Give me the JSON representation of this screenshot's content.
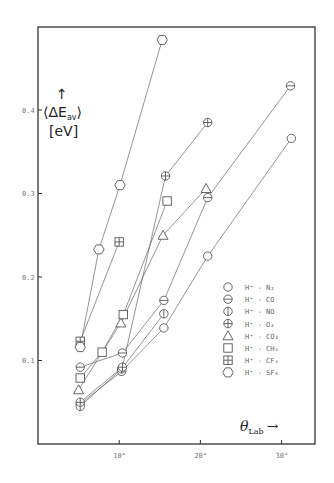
{
  "chart_data": {
    "type": "line",
    "title": "",
    "xlabel": "θ_Lab →",
    "ylabel": "↑ ⟨ΔE_av⟩ [eV]",
    "xlim": [
      0,
      34
    ],
    "ylim": [
      0,
      0.5
    ],
    "x_ticks": [
      {
        "value": 10,
        "label": "10°"
      },
      {
        "value": 20,
        "label": "20°"
      },
      {
        "value": 30,
        "label": "30°"
      }
    ],
    "y_ticks": [
      {
        "value": 0.1,
        "label": "0.1"
      },
      {
        "value": 0.2,
        "label": "0.2"
      },
      {
        "value": 0.3,
        "label": "0.3"
      },
      {
        "value": 0.4,
        "label": "0.4"
      }
    ],
    "grid": false,
    "legend_position": "right-middle",
    "series": [
      {
        "name": "H+ - N2",
        "marker": "circle",
        "x": [
          5.2,
          10.3,
          15.5,
          20.9,
          31.2
        ],
        "y": [
          0.048,
          0.087,
          0.139,
          0.225,
          0.366
        ]
      },
      {
        "name": "H+ - CO",
        "marker": "circle-hbar",
        "x": [
          5.2,
          10.4,
          15.5,
          20.9,
          31.1
        ],
        "y": [
          0.092,
          0.109,
          0.172,
          0.295,
          0.429
        ]
      },
      {
        "name": "H+ - NO",
        "marker": "circle-vbar",
        "x": [
          5.2,
          10.3,
          15.5
        ],
        "y": [
          0.045,
          0.09,
          0.156
        ]
      },
      {
        "name": "H+ - O2",
        "marker": "circle-cross",
        "x": [
          5.2,
          10.4,
          15.7,
          20.9
        ],
        "y": [
          0.05,
          0.092,
          0.321,
          0.385
        ]
      },
      {
        "name": "H+ - CO2",
        "marker": "triangle",
        "x": [
          5.0,
          10.2,
          15.4,
          20.7
        ],
        "y": [
          0.065,
          0.145,
          0.25,
          0.306
        ]
      },
      {
        "name": "H+ - CH4",
        "marker": "square",
        "x": [
          5.2,
          7.9,
          10.5,
          15.9
        ],
        "y": [
          0.079,
          0.11,
          0.155,
          0.291
        ]
      },
      {
        "name": "H+ - CF4",
        "marker": "square-vbar",
        "x": [
          5.2,
          10.0
        ],
        "y": [
          0.123,
          0.242
        ]
      },
      {
        "name": "H+ - SF6",
        "marker": "hexagon",
        "x": [
          5.2,
          7.5,
          10.1,
          15.3
        ],
        "y": [
          0.116,
          0.233,
          0.31,
          0.484
        ]
      }
    ]
  },
  "axes": {
    "y_label_arrow": "↑",
    "y_label_main": "⟨ΔE",
    "y_label_sub": "av",
    "y_label_close": "⟩",
    "y_unit": "[eV]",
    "x_label_main": "θ",
    "x_label_sub": "Lab",
    "x_label_arrow": "→"
  },
  "legend": [
    {
      "marker": "circle",
      "label": "H⁺ - N₂"
    },
    {
      "marker": "circle-hbar",
      "label": "H⁺ - CO"
    },
    {
      "marker": "circle-vbar",
      "label": "H⁺ - NO"
    },
    {
      "marker": "circle-cross",
      "label": "H⁺ - O₂"
    },
    {
      "marker": "triangle",
      "label": "H⁺ - CO₂"
    },
    {
      "marker": "square",
      "label": "H⁺ - CH₄"
    },
    {
      "marker": "square-vbar",
      "label": "H⁺ - CF₄"
    },
    {
      "marker": "hexagon",
      "label": "H⁺ - SF₆"
    }
  ]
}
